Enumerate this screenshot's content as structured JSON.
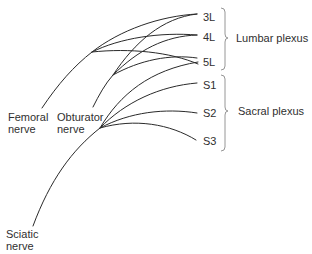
{
  "diagram": {
    "roots": [
      {
        "id": "3L",
        "label": "3L"
      },
      {
        "id": "4L",
        "label": "4L"
      },
      {
        "id": "5L",
        "label": "5L"
      },
      {
        "id": "S1",
        "label": "S1"
      },
      {
        "id": "S2",
        "label": "S2"
      },
      {
        "id": "S3",
        "label": "S3"
      }
    ],
    "groups": [
      {
        "id": "lumbar",
        "label": "Lumbar plexus",
        "members": [
          "3L",
          "4L",
          "5L"
        ]
      },
      {
        "id": "sacral",
        "label": "Sacral plexus",
        "members": [
          "S1",
          "S2",
          "S3"
        ]
      }
    ],
    "nerves": [
      {
        "id": "femoral",
        "line1": "Femoral",
        "line2": "nerve",
        "roots": [
          "3L",
          "4L",
          "5L"
        ]
      },
      {
        "id": "obturator",
        "line1": "Obturator",
        "line2": "nerve",
        "roots": [
          "3L",
          "4L",
          "5L"
        ]
      },
      {
        "id": "sciatic",
        "line1": "Sciatic",
        "line2": "nerve",
        "roots": [
          "5L",
          "S1",
          "S2",
          "S3"
        ]
      }
    ],
    "line_color": "#2a2a2a",
    "brace_color": "#8a8a8a"
  }
}
